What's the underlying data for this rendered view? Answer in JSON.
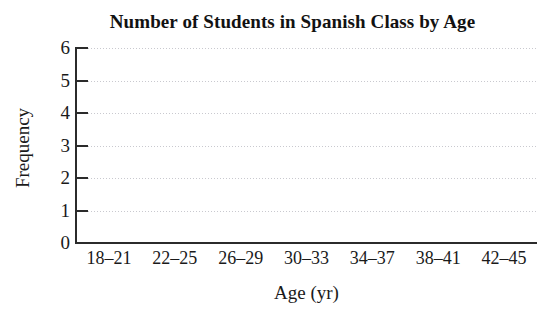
{
  "chart_data": {
    "type": "bar",
    "title": "Number of Students in Spanish Class by Age",
    "xlabel": "Age (yr)",
    "ylabel": "Frequency",
    "categories": [
      "18–21",
      "22–25",
      "26–29",
      "30–33",
      "34–37",
      "38–41",
      "42–45"
    ],
    "values": [
      0,
      0,
      0,
      0,
      0,
      0,
      0
    ],
    "ylim": [
      0,
      6
    ],
    "ytick_labels": [
      "0",
      "1",
      "2",
      "3",
      "4",
      "5",
      "6"
    ],
    "ytick_values": [
      0,
      1,
      2,
      3,
      4,
      5,
      6
    ],
    "grid": true,
    "grid_axis": "y",
    "grid_style": "dotted",
    "legend": false,
    "note": "Blank histogram template — axes and gridlines drawn, no bars plotted",
    "colors": {
      "background": "#ffffff",
      "axis": "#2b2b2b",
      "gridline": "#c9c9cf",
      "text": "#1a1a1a",
      "title": "#121212",
      "bar": "#6b6b6b"
    }
  }
}
